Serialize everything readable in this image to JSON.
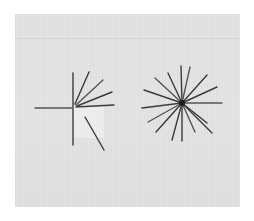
{
  "scene": {
    "description": "Photograph of sticks arranged on a light grey board: a broken/partial star at left and a complete radial star at right",
    "colors": {
      "background": "#ffffff",
      "board": "#e2e2e2",
      "stick": "#3b3b3b",
      "hub": "#1e1e1e"
    }
  },
  "figures": [
    {
      "name": "left-partial-star",
      "center": [
        74,
        107
      ],
      "sticks": [
        [
          73,
          73,
          73,
          145
        ],
        [
          35,
          108,
          72,
          108
        ],
        [
          76,
          107,
          114,
          105
        ],
        [
          75,
          104,
          89,
          72
        ],
        [
          76,
          105,
          103,
          80
        ],
        [
          77,
          106,
          112,
          92
        ],
        [
          85,
          117,
          104,
          150
        ]
      ]
    },
    {
      "name": "right-full-star",
      "center": [
        182,
        103
      ],
      "hub_radius": 3,
      "sticks": [
        [
          182,
          103,
          181,
          66
        ],
        [
          182,
          103,
          190,
          67
        ],
        [
          182,
          103,
          168,
          73
        ],
        [
          182,
          103,
          207,
          75
        ],
        [
          182,
          103,
          155,
          78
        ],
        [
          182,
          103,
          217,
          87
        ],
        [
          182,
          103,
          144,
          90
        ],
        [
          182,
          103,
          222,
          103
        ],
        [
          182,
          103,
          142,
          108
        ],
        [
          182,
          103,
          207,
          123
        ],
        [
          182,
          103,
          148,
          122
        ],
        [
          182,
          103,
          212,
          133
        ],
        [
          182,
          103,
          156,
          132
        ],
        [
          182,
          103,
          195,
          132
        ],
        [
          182,
          103,
          172,
          140
        ],
        [
          182,
          103,
          182,
          141
        ]
      ]
    }
  ]
}
